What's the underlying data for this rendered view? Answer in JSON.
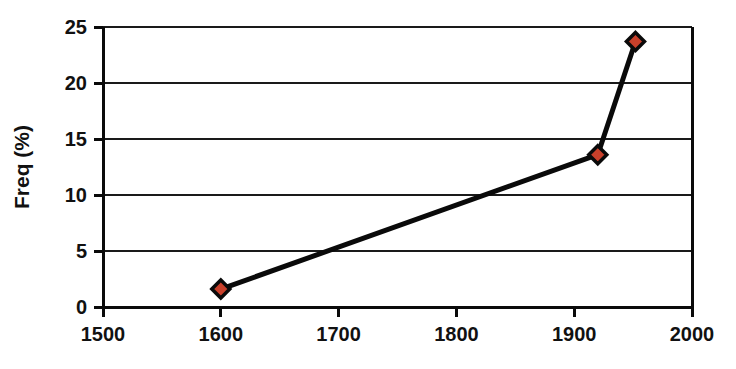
{
  "chart_data": {
    "type": "line",
    "title": "",
    "subtitle": "",
    "xlabel": "",
    "ylabel": "Freq (%)",
    "xlim": [
      1500,
      2000
    ],
    "ylim": [
      0,
      25
    ],
    "xticks": [
      1500,
      1600,
      1700,
      1800,
      1900,
      2000
    ],
    "xtick_labels": [
      "1500",
      "1600",
      "1700",
      "1800",
      "1900",
      "2000"
    ],
    "yticks": [
      0,
      5,
      10,
      15,
      20,
      25
    ],
    "ytick_labels": [
      "0",
      "5",
      "10",
      "15",
      "20",
      "25"
    ],
    "grid": "horizontal",
    "legend": "none",
    "series": [
      {
        "name": "Freq",
        "marker": "diamond",
        "marker_fill": "#C9402B",
        "marker_edge": "#0A0A0A",
        "line_color": "#0A0A0A",
        "x": [
          1600,
          1920,
          1952
        ],
        "values": [
          1.6,
          13.6,
          23.7
        ]
      }
    ]
  },
  "style": {
    "background": "#FFFFFF",
    "axis_color": "#0A0A0A",
    "grid_color": "#1A1A1A",
    "text_color": "#111111"
  }
}
